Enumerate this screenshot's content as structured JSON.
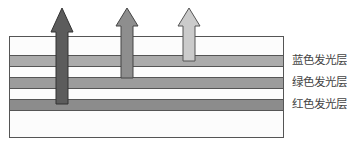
{
  "diagram": {
    "type": "layered-stack",
    "layers": [
      {
        "id": "blue",
        "label": "蓝色发光层",
        "color": "#a9a9a9",
        "top": 18,
        "height": 12
      },
      {
        "id": "green",
        "label": "绿色发光层",
        "color": "#9a9a9a",
        "top": 40,
        "height": 12
      },
      {
        "id": "red",
        "label": "红色发光层",
        "color": "#8a8a8a",
        "top": 62,
        "height": 12
      }
    ],
    "arrows": [
      {
        "id": "red-emission",
        "color": "#5f5f5f",
        "x": 62,
        "tip_y": 8,
        "base_y": 104
      },
      {
        "id": "green-emission",
        "color": "#8c8c8c",
        "x": 126,
        "tip_y": 8,
        "base_y": 78
      },
      {
        "id": "blue-emission",
        "color": "#c8c8c8",
        "x": 188,
        "tip_y": 8,
        "base_y": 61
      }
    ]
  },
  "labels": {
    "blue": "蓝色发光层",
    "green": "绿色发光层",
    "red": "红色发光层"
  }
}
